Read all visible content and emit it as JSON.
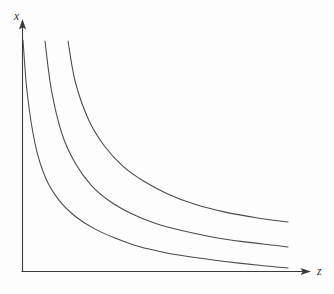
{
  "chart_data": {
    "type": "line",
    "title": "",
    "subtitle": "",
    "xlabel": "z",
    "ylabel": "x",
    "grid": false,
    "legend": "none",
    "axis_style": "arrowed-L-axes",
    "xlim": [
      0,
      100
    ],
    "ylim": [
      0,
      100
    ],
    "annotations": [],
    "series": [
      {
        "name": "curve-1",
        "label": "",
        "note": "innermost curve, closest to origin",
        "x": [
          0.4,
          2,
          5,
          9,
          14,
          20,
          27,
          35,
          44,
          54,
          65,
          77,
          90,
          100
        ],
        "y": [
          100,
          78,
          57,
          43,
          34,
          27.5,
          22.5,
          18.5,
          15,
          12.5,
          10.5,
          8.8,
          7.2,
          6.2
        ],
        "pixel_start": [
          23,
          40
        ],
        "pixel_end": [
          288,
          268
        ]
      },
      {
        "name": "curve-2",
        "label": "",
        "note": "middle curve",
        "x": [
          8.6,
          11,
          15,
          20,
          26,
          33,
          41,
          50,
          60,
          71,
          83,
          95,
          100
        ],
        "y": [
          100,
          80,
          62,
          50,
          41,
          34.5,
          29.5,
          25.5,
          22.5,
          20,
          18,
          16.5,
          15.8
        ],
        "pixel_start": [
          45,
          41
        ],
        "pixel_end": [
          288,
          247
        ]
      },
      {
        "name": "curve-3",
        "label": "",
        "note": "outermost curve, furthest from origin",
        "x": [
          17.3,
          20,
          25,
          31,
          38,
          46,
          55,
          65,
          76,
          88,
          100
        ],
        "y": [
          100,
          84,
          69,
          58.5,
          50.5,
          44.5,
          39.5,
          35.5,
          32.5,
          30.2,
          28.5
        ],
        "pixel_start": [
          68,
          41
        ],
        "pixel_end": [
          288,
          222
        ]
      }
    ],
    "colors": {
      "background": "#fdfdfd",
      "axis": "#3a3a3a",
      "curve": "#4a4a4a",
      "label": "#2e2e2e"
    }
  },
  "axes": {
    "y_label": "x",
    "x_label": "z"
  }
}
